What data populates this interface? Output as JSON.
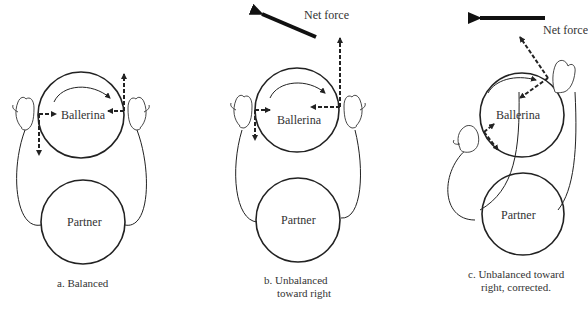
{
  "panels": [
    {
      "id": "a",
      "caption_line1": "a. Balanced",
      "caption_line2": "",
      "top_circle": "Ballerina",
      "bottom_circle": "Partner",
      "net_force_label": ""
    },
    {
      "id": "b",
      "caption_line1": "b. Unbalanced",
      "caption_line2": "toward right",
      "top_circle": "Ballerina",
      "bottom_circle": "Partner",
      "net_force_label": "Net force"
    },
    {
      "id": "c",
      "caption_line1": "c. Unbalanced toward",
      "caption_line2": "right, corrected.",
      "top_circle": "Ballerina",
      "bottom_circle": "Partner",
      "net_force_label": "Net force"
    }
  ],
  "colors": {
    "stroke": "#222222",
    "text": "#333333",
    "background": "#ffffff"
  }
}
